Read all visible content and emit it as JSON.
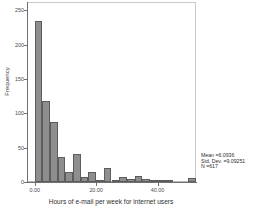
{
  "chart_data": {
    "type": "bar",
    "title": "",
    "subtitle": "",
    "xlabel": "Hours of e-mail per week for internet users",
    "ylabel": "Frequency",
    "xlim": [
      -2.5,
      52.5
    ],
    "ylim": [
      0,
      262
    ],
    "grid": false,
    "legend": null,
    "bin_width": 2.5,
    "categories": [
      "0.0",
      "2.5",
      "5.0",
      "7.5",
      "10.0",
      "12.5",
      "15.0",
      "17.5",
      "20.0",
      "22.5",
      "25.0",
      "27.5",
      "30.0",
      "32.5",
      "35.0",
      "37.5",
      "40.0",
      "42.5",
      "45.0",
      "47.5",
      "50.0"
    ],
    "values": [
      235,
      118,
      88,
      37,
      15,
      41,
      7,
      15,
      1,
      21,
      1,
      7,
      4,
      9,
      4,
      1,
      3,
      1,
      0,
      0,
      6
    ],
    "x_ticks": [
      {
        "value": 0,
        "label": "0.00"
      },
      {
        "value": 20,
        "label": "20.00"
      },
      {
        "value": 40,
        "label": "40.00"
      }
    ],
    "y_ticks": [
      {
        "value": 0,
        "label": "0"
      },
      {
        "value": 50,
        "label": "50"
      },
      {
        "value": 100,
        "label": "100"
      },
      {
        "value": 150,
        "label": "150"
      },
      {
        "value": 200,
        "label": "200"
      },
      {
        "value": 250,
        "label": "250"
      }
    ],
    "annotations": {
      "mean": "Mean =6.0936",
      "std_dev": "Std. Dev. =9.09251",
      "n": "N =617"
    },
    "colors": {
      "bar_fill": "#8e8e8e",
      "bar_edge": "#5d5d5d",
      "axis": "#707070",
      "frame": "#b9b9b9",
      "text": "#2f2f2f",
      "background": "#ffffff"
    }
  }
}
